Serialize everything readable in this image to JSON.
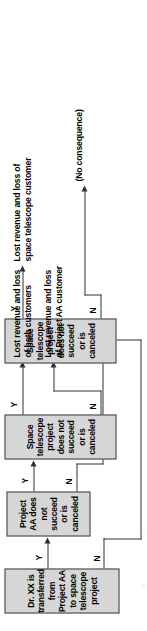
{
  "diagram": {
    "type": "decision-tree-flowchart",
    "title": "",
    "orientation": "rotated-90-ccw",
    "colors": {
      "node_fill": "#d6d6d6",
      "node_border": "#3a3a3a",
      "line": "#303030",
      "background": "#ffffff",
      "text": "#000000"
    },
    "nodes": [
      {
        "id": "n1",
        "label": "Dr. XX is transferred from Project AA to space telescope project",
        "yes_label": "Y",
        "no_label": "N"
      },
      {
        "id": "n2",
        "label": "Project AA does not succeed or is canceled",
        "yes_label": "Y",
        "no_label": "N"
      },
      {
        "id": "n3",
        "label": "Space telescope project does not succeed or is canceled",
        "yes_label": "Y",
        "no_label": "N"
      },
      {
        "id": "n4",
        "label": "Space telescope project does not succeed or is canceled",
        "yes_label": "Y",
        "no_label": "N"
      }
    ],
    "outcomes": [
      {
        "id": "o1",
        "label": "Lost revenue and loss\nof both customers"
      },
      {
        "id": "o2",
        "label": "Lost revenue and loss\nof Project AA customer"
      },
      {
        "id": "o3",
        "label": "Lost revenue and loss of\nspace telescope customer"
      },
      {
        "id": "o4",
        "label": "(No consequence)"
      }
    ]
  }
}
